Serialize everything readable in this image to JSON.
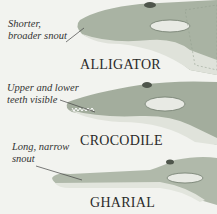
{
  "panels": [
    {
      "name": "ALLIGATOR",
      "note_lines": [
        "Shorter,",
        "broader snout"
      ]
    },
    {
      "name": "CROCODILE",
      "note_lines": [
        "Upper and lower",
        "teeth visible"
      ]
    },
    {
      "name": "GHARIAL",
      "note_lines": [
        "Long, narrow",
        "snout"
      ]
    }
  ],
  "colors": {
    "background": "#f2f3ef",
    "skin_light": "#c9cfc3",
    "skin_dark": "#7d8a78",
    "belly": "#e4e6df"
  }
}
